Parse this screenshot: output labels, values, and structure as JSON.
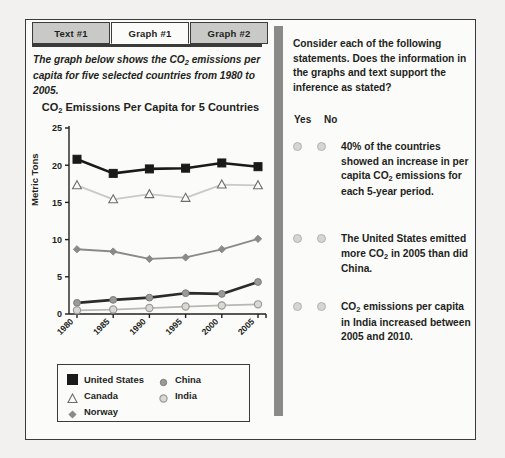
{
  "tabs": [
    {
      "label": "Text #1",
      "active": false
    },
    {
      "label": "Graph #1",
      "active": true
    },
    {
      "label": "Graph #2",
      "active": false
    }
  ],
  "intro": {
    "before": "The graph below shows the CO",
    "sub": "2",
    "after": " emissions per capita for five selected countries from 1980 to 2005."
  },
  "right_panel": {
    "prompt": "Consider each of the following statements. Does the information in the graphs and text support the inference as stated?",
    "yes_label": "Yes",
    "no_label": "No",
    "questions": [
      {
        "id": "q1",
        "parts": [
          "40% of the countries showed an increase in per capita CO",
          "2",
          " emissions for each 5-year period."
        ],
        "selected": null
      },
      {
        "id": "q2",
        "parts": [
          "The United States emitted more CO",
          "2",
          " in 2005 than did China."
        ],
        "selected": null
      },
      {
        "id": "q3",
        "parts": [
          "CO",
          "2",
          " emissions per capita in India increased between 2005 and 2010."
        ],
        "selected": null
      }
    ]
  },
  "chart_data": {
    "type": "line",
    "title_before": "CO",
    "title_sub": "2",
    "title_after": " Emissions Per Capita for 5 Countries",
    "title": "CO2 Emissions Per Capita for 5 Countries",
    "xlabel": "",
    "ylabel": "Metric Tons",
    "categories": [
      "1980",
      "1985",
      "1990",
      "1995",
      "2000",
      "2005"
    ],
    "yticks": [
      0,
      5,
      10,
      15,
      20,
      25
    ],
    "ylim": [
      0,
      25
    ],
    "grid": false,
    "legend_position": "below-plot",
    "series": [
      {
        "name": "United States",
        "marker": "filled-square",
        "color": "#1a1a1a",
        "values": [
          20.8,
          18.9,
          19.5,
          19.6,
          20.3,
          19.8
        ]
      },
      {
        "name": "Canada",
        "marker": "open-triangle",
        "color": "#c9c9c7",
        "values": [
          17.3,
          15.4,
          16.1,
          15.6,
          17.4,
          17.3
        ]
      },
      {
        "name": "Norway",
        "marker": "diamond",
        "color": "#8a8a88",
        "values": [
          8.7,
          8.4,
          7.4,
          7.6,
          8.7,
          10.1
        ]
      },
      {
        "name": "China",
        "marker": "small-circle",
        "color": "#2b2b2b",
        "values": [
          1.5,
          1.9,
          2.2,
          2.8,
          2.7,
          4.3
        ]
      },
      {
        "name": "India",
        "marker": "open-circle",
        "color": "#b9b8b5",
        "values": [
          0.5,
          0.6,
          0.8,
          1.0,
          1.15,
          1.3
        ]
      }
    ]
  }
}
